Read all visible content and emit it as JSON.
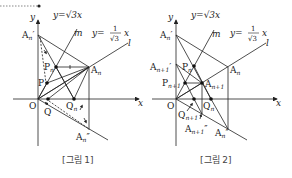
{
  "header": {
    "box_label": ""
  },
  "figures": [
    {
      "caption": "[그림 1]",
      "axes": {
        "x_label": "x",
        "y_label": "y",
        "origin_label": "O"
      },
      "lines": {
        "m": {
          "name": "m",
          "equation": "y=√3x"
        },
        "l": {
          "name": "l",
          "equation_lhs": "y=",
          "equation_num": "1",
          "equation_den": "√3",
          "equation_var": "x"
        }
      },
      "points": {
        "An_prime": "A",
        "An_prime_sub": "n",
        "An_prime_mark": "′",
        "An": "A",
        "An_sub": "n",
        "Pn": "P",
        "Pn_sub": "n",
        "P": "P",
        "Q": "Q",
        "Qn": "Q",
        "Qn_sub": "n",
        "An_dprime": "A",
        "An_dprime_sub": "n",
        "An_dprime_mark": "″"
      }
    },
    {
      "caption": "[그림 2]",
      "axes": {
        "x_label": "x",
        "y_label": "y",
        "origin_label": "O"
      },
      "lines": {
        "m": {
          "name": "m",
          "equation": "y=√3x"
        },
        "l": {
          "name": "l",
          "equation_lhs": "y=",
          "equation_num": "1",
          "equation_den": "√3",
          "equation_var": "x"
        }
      },
      "points": {
        "An_prime": "A",
        "An_prime_sub": "n",
        "An_prime_mark": "′",
        "An1_prime": "A",
        "An1_prime_sub": "n+1",
        "An1_prime_mark": "′",
        "Pn": "P",
        "Pn_sub": "n",
        "Pn1": "P",
        "Pn1_sub": "n+1",
        "An1": "A",
        "An1_sub": "n+1",
        "An": "A",
        "An_sub": "n",
        "Qn": "Q",
        "Qn_sub": "n",
        "Qn1": "Q",
        "Qn1_sub": "n+1",
        "An1_dprime": "A",
        "An1_dprime_sub": "n+1",
        "An1_dprime_mark": "″",
        "An_dprime": "A",
        "An_dprime_sub": "n",
        "An_dprime_mark": "″"
      }
    }
  ],
  "colors": {
    "ink": "#222222",
    "caption": "#444444",
    "dashed_box": "#555555"
  }
}
